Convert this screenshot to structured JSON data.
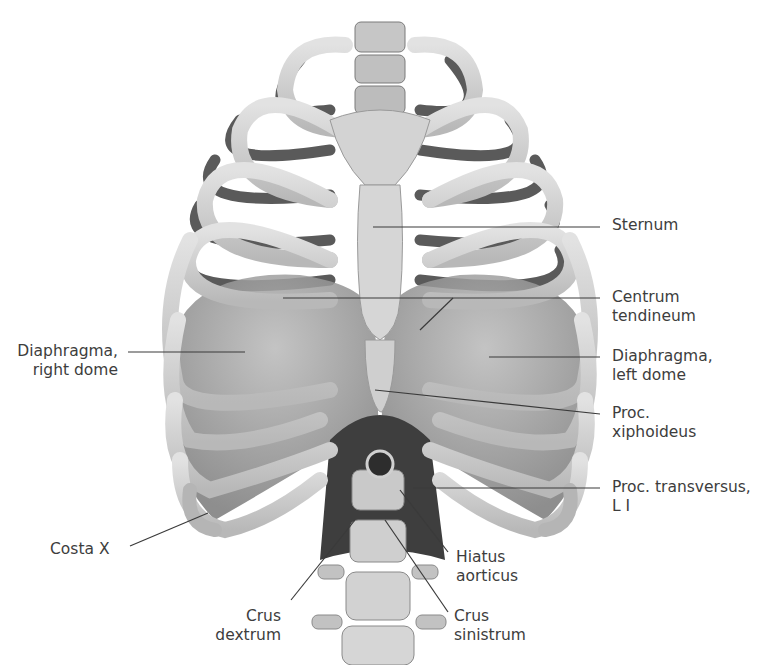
{
  "figure": {
    "colors": {
      "background": "#ffffff",
      "bone_light": "#d9d9d9",
      "bone_mid": "#bdbdbd",
      "bone_shadow": "#8a8a8a",
      "rib_back": "#5e5e5e",
      "muscle": "#8f8f8f",
      "muscle_dark": "#4d4d4d",
      "leader_line": "#3a3a3a",
      "label_text": "#3d3d3d"
    }
  },
  "labels": {
    "sternum": "Sternum",
    "centrum_tendineum": "Centrum\ntendineum",
    "diaphragma_left": "Diaphragma,\nleft dome",
    "proc_xiphoideus": "Proc.\nxiphoideus",
    "proc_transversus": "Proc. transversus,\nL I",
    "hiatus_aorticus": "Hiatus\naorticus",
    "crus_sinistrum": "Crus\nsinistrum",
    "crus_dextrum": "Crus\ndextrum",
    "costa_x": "Costa X",
    "diaphragma_right": "Diaphragma,\nright dome"
  }
}
